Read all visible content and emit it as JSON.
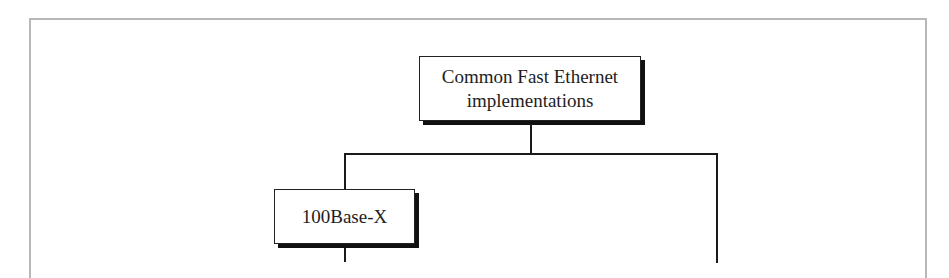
{
  "diagram": {
    "type": "tree",
    "root": {
      "label_line1": "Common Fast Ethernet",
      "label_line2": "implementations"
    },
    "children": [
      {
        "label": "100Base-X"
      }
    ],
    "colors": {
      "frame_border": "#b8b8b8",
      "box_border": "#222222",
      "shadow": "#111111",
      "line": "#1a1a1a",
      "background": "#ffffff"
    }
  }
}
